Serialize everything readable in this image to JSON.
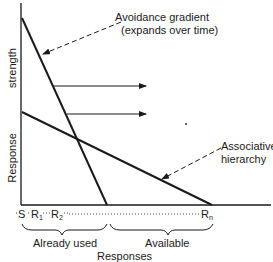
{
  "diagram": {
    "y_axis_label_top": "strength",
    "y_axis_label_bottom": "Response",
    "x_axis_label": "Responses",
    "lines": [
      {
        "name": "Avoidance gradient",
        "annotation_line1": "Avoidance gradient",
        "annotation_line2": "(expands over time)"
      },
      {
        "name": "Associative hierarchy",
        "annotation_line1": "Associative",
        "annotation_line2": "hierarchy"
      }
    ],
    "x_sequence": {
      "start": "S",
      "r1": "R",
      "r1_sub": "1",
      "r2": "R",
      "r2_sub": "2",
      "rn": "R",
      "rn_sub": "n"
    },
    "braces": [
      {
        "label": "Already used"
      },
      {
        "label": "Available"
      }
    ],
    "shift_arrows_count": 2,
    "colors": {
      "ink": "#1a1a1a",
      "background": "#ffffff"
    }
  }
}
